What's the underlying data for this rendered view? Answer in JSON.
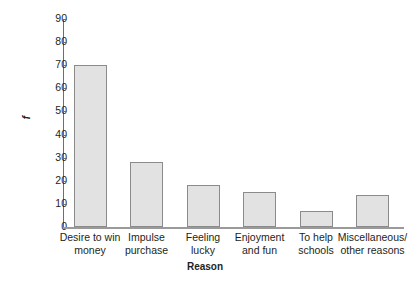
{
  "chart_data": {
    "type": "bar",
    "title": "",
    "xlabel": "Reason",
    "ylabel": "f",
    "categories": [
      "Desire to win money",
      "Impulse purchase",
      "Feeling lucky",
      "Enjoyment and fun",
      "To help schools",
      "Miscellaneous/ other reasons"
    ],
    "category_lines": [
      [
        "Desire to win",
        "money"
      ],
      [
        "Impulse",
        "purchase"
      ],
      [
        "Feeling",
        "lucky"
      ],
      [
        "Enjoyment",
        "and fun"
      ],
      [
        "To help",
        "schools"
      ],
      [
        "Miscellaneous/",
        "other reasons"
      ]
    ],
    "values": [
      70,
      28,
      18,
      15,
      7,
      14
    ],
    "ylim": [
      0,
      90
    ],
    "ytick_step": 10,
    "ytick_labels": [
      "90",
      "80",
      "70",
      "60",
      "50",
      "40",
      "30",
      "20",
      "10",
      "0"
    ],
    "grid": false,
    "legend": false,
    "colors": {
      "bar_fill": "#e2e2e2",
      "bar_border": "#8b8b8b",
      "axis": "#6e6e6e",
      "baseline": "#9a9a9a",
      "text": "#231f20",
      "background": "#ffffff"
    }
  }
}
